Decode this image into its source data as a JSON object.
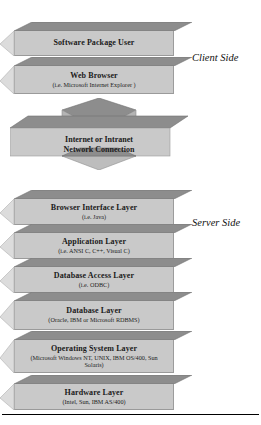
{
  "diagram": {
    "side_labels": [
      {
        "name": "client-side",
        "text": "Client Side"
      },
      {
        "name": "server-side",
        "text": "Server Side"
      }
    ],
    "client_blocks": [
      {
        "id": "software-package-user",
        "title": "Software Package User",
        "subtitle": ""
      },
      {
        "id": "web-browser",
        "title": "Web Browser",
        "subtitle": "(i.e. Microsoft Internet Explorer )"
      }
    ],
    "connector": {
      "id": "internet-intranet-network-connection",
      "title_line1": "Internet or Intranet",
      "title_line2": "Network Connection",
      "direction": "bidirectional"
    },
    "server_blocks": [
      {
        "id": "browser-interface-layer",
        "title": "Browser Interface Layer",
        "subtitle": "(i.e. Java)"
      },
      {
        "id": "application-layer",
        "title": "Application Layer",
        "subtitle": "(i.e. ANSI C, C++, Visual C)"
      },
      {
        "id": "database-access-layer",
        "title": "Database Access Layer",
        "subtitle": "(i.e. ODBC)"
      },
      {
        "id": "database-layer",
        "title": "Database Layer",
        "subtitle": "(Oracle, IBM or Microsoft RDBMS)"
      },
      {
        "id": "operating-system-layer",
        "title": "Operating System Layer",
        "subtitle": "(Microsoft Windows NT, UNIX, IBM OS/400, Sun Solaris)"
      },
      {
        "id": "hardware-layer",
        "title": "Hardware Layer",
        "subtitle": "(Intel, Sun, IBM AS/400)"
      }
    ],
    "colors": {
      "block_front": "#c9c9c9",
      "block_top": "#8d8d8d",
      "block_side": "#dcdcdc",
      "text": "#1a1a1a",
      "rule": "#000000"
    }
  }
}
